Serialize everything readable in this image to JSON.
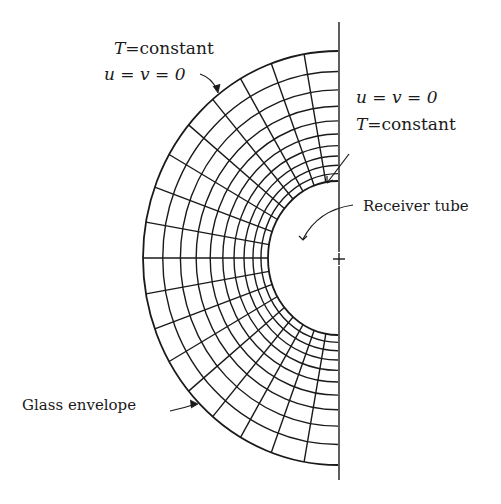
{
  "figure": {
    "type": "finite-element mesh, half annulus",
    "colors": {
      "ink": "#1a1a1a",
      "background": "#ffffff"
    },
    "geometry": {
      "center": [
        338,
        258
      ],
      "outer_radius": [
        195,
        207
      ],
      "inner_radius": [
        70,
        77
      ],
      "ring_count": 11,
      "angular_divisions": 18,
      "axis_top": 22,
      "axis_bottom": 480
    }
  },
  "labels": {
    "outer_bc_line1_var": "T",
    "outer_bc_line1_rest": "=constant",
    "outer_bc_line2": "u = v = 0",
    "inner_bc_line1": "u = v = 0",
    "inner_bc_line2_var": "T",
    "inner_bc_line2_rest": "=constant",
    "receiver_tube": "Receiver tube",
    "glass_envelope": "Glass envelope"
  }
}
